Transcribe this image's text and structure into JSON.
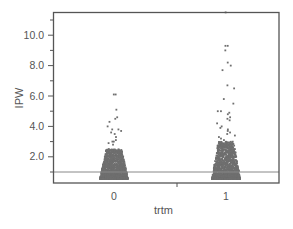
{
  "chart_data": {
    "type": "scatter",
    "title": "",
    "xlabel": "trtm",
    "ylabel": "IPW",
    "categories": [
      "0",
      "1"
    ],
    "yticks": [
      2.0,
      4.0,
      6.0,
      8.0,
      10.0
    ],
    "ytick_labels": [
      "2.0",
      "4.0",
      "6.0",
      "8.0",
      "10.0"
    ],
    "ylim": [
      0.3,
      11.5
    ],
    "reference_line": 1.0,
    "grid": false,
    "legend": null,
    "series": [
      {
        "name": "trtm=0",
        "category": "0",
        "bulk_range": [
          0.5,
          2.5
        ],
        "max": 6.1,
        "outliers": [
          6.1,
          6.1,
          5.1,
          4.6,
          4.5,
          4.3,
          4.0,
          3.8,
          3.8,
          3.7,
          3.6,
          3.5,
          3.3,
          3.1,
          3.0,
          3.0,
          2.9,
          2.8
        ]
      },
      {
        "name": "trtm=1",
        "category": "1",
        "bulk_range": [
          0.5,
          3.0
        ],
        "max": 11.5,
        "outliers": [
          11.5,
          9.3,
          9.3,
          9.0,
          8.2,
          8.0,
          7.7,
          6.7,
          6.5,
          5.8,
          5.5,
          5.0,
          5.0,
          4.9,
          4.8,
          4.6,
          4.5,
          4.4,
          4.2,
          4.0,
          3.9,
          3.8,
          3.7,
          3.6,
          3.5,
          3.4,
          3.3,
          3.2,
          3.1
        ]
      }
    ]
  },
  "colors": {
    "points": "#6f6f6f",
    "axis": "#555555",
    "reference_line": "#777777"
  }
}
